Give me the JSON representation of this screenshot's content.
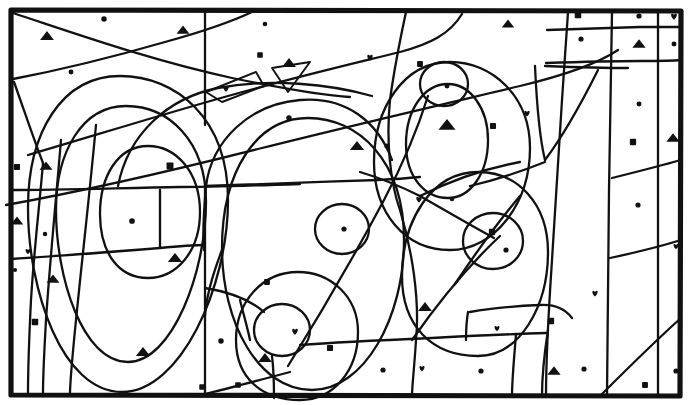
{
  "figure": {
    "kind": "line-drawing",
    "width": 690,
    "height": 405,
    "background_color": "#ffffff",
    "ink_color": "#111111",
    "frame": {
      "x": 9,
      "y": 8,
      "width": 672,
      "height": 389,
      "stroke_width": 5,
      "label": "outer-border"
    },
    "symbol_legend": [
      {
        "key": "dot",
        "name": "filled-circle-symbol",
        "glyph": "●",
        "count": 24
      },
      {
        "key": "triangle",
        "name": "filled-triangle-symbol",
        "glyph": "▲",
        "count": 21
      },
      {
        "key": "square",
        "name": "filled-square-symbol",
        "glyph": "■",
        "count": 22
      },
      {
        "key": "heart",
        "name": "filled-heart-symbol",
        "glyph": "♥",
        "count": 15
      }
    ],
    "symbols": [
      {
        "t": "dot",
        "x": 104,
        "y": 19,
        "s": 4.4
      },
      {
        "t": "triangle",
        "x": 47,
        "y": 36,
        "s": 6.0
      },
      {
        "t": "triangle",
        "x": 183,
        "y": 30,
        "s": 5.6
      },
      {
        "t": "dot",
        "x": 265,
        "y": 24,
        "s": 3.8
      },
      {
        "t": "triangle",
        "x": 508,
        "y": 24,
        "s": 5.4
      },
      {
        "t": "square",
        "x": 578,
        "y": 15,
        "s": 6.0
      },
      {
        "t": "dot",
        "x": 639,
        "y": 16,
        "s": 4.2
      },
      {
        "t": "heart",
        "x": 674,
        "y": 16,
        "s": 6.6
      },
      {
        "t": "dot",
        "x": 71,
        "y": 72,
        "s": 4.0
      },
      {
        "t": "square",
        "x": 260,
        "y": 55,
        "s": 5.2
      },
      {
        "t": "triangle",
        "x": 289,
        "y": 63,
        "s": 6.0
      },
      {
        "t": "heart",
        "x": 226,
        "y": 88,
        "s": 6.4
      },
      {
        "t": "heart",
        "x": 370,
        "y": 57,
        "s": 6.2
      },
      {
        "t": "square",
        "x": 420,
        "y": 64,
        "s": 5.4
      },
      {
        "t": "dot",
        "x": 581,
        "y": 39,
        "s": 4.2
      },
      {
        "t": "triangle",
        "x": 639,
        "y": 44,
        "s": 5.8
      },
      {
        "t": "dot",
        "x": 674,
        "y": 44,
        "s": 4.0
      },
      {
        "t": "dot",
        "x": 447,
        "y": 86,
        "s": 4.0
      },
      {
        "t": "dot",
        "x": 289,
        "y": 118,
        "s": 4.4
      },
      {
        "t": "triangle",
        "x": 447,
        "y": 125,
        "s": 7.4
      },
      {
        "t": "square",
        "x": 493,
        "y": 126,
        "s": 5.6
      },
      {
        "t": "heart",
        "x": 527,
        "y": 113,
        "s": 6.0
      },
      {
        "t": "square",
        "x": 170,
        "y": 166,
        "s": 6.4
      },
      {
        "t": "square",
        "x": 17,
        "y": 167,
        "s": 5.6
      },
      {
        "t": "triangle",
        "x": 46,
        "y": 166,
        "s": 5.6
      },
      {
        "t": "triangle",
        "x": 357,
        "y": 146,
        "s": 6.2
      },
      {
        "t": "dot",
        "x": 387,
        "y": 146,
        "s": 4.2
      },
      {
        "t": "square",
        "x": 633,
        "y": 142,
        "s": 5.8
      },
      {
        "t": "triangle",
        "x": 673,
        "y": 138,
        "s": 5.8
      },
      {
        "t": "dot",
        "x": 132,
        "y": 221,
        "s": 4.6
      },
      {
        "t": "triangle",
        "x": 17,
        "y": 221,
        "s": 5.4
      },
      {
        "t": "dot",
        "x": 45,
        "y": 234,
        "s": 3.6
      },
      {
        "t": "heart",
        "x": 28,
        "y": 251,
        "s": 5.6
      },
      {
        "t": "dot",
        "x": 15,
        "y": 270,
        "s": 3.4
      },
      {
        "t": "triangle",
        "x": 175,
        "y": 258,
        "s": 6.2
      },
      {
        "t": "dot",
        "x": 344,
        "y": 229,
        "s": 4.2
      },
      {
        "t": "heart",
        "x": 419,
        "y": 199,
        "s": 6.2
      },
      {
        "t": "square",
        "x": 492,
        "y": 232,
        "s": 5.8
      },
      {
        "t": "dot",
        "x": 506,
        "y": 250,
        "s": 4.2
      },
      {
        "t": "dot",
        "x": 638,
        "y": 205,
        "s": 4.2
      },
      {
        "t": "heart",
        "x": 676,
        "y": 246,
        "s": 5.6
      },
      {
        "t": "triangle",
        "x": 53,
        "y": 279,
        "s": 5.6
      },
      {
        "t": "square",
        "x": 267,
        "y": 282,
        "s": 5.4
      },
      {
        "t": "square",
        "x": 35,
        "y": 322,
        "s": 6.0
      },
      {
        "t": "triangle",
        "x": 425,
        "y": 307,
        "s": 6.0
      },
      {
        "t": "heart",
        "x": 295,
        "y": 331,
        "s": 6.4
      },
      {
        "t": "heart",
        "x": 497,
        "y": 328,
        "s": 5.6
      },
      {
        "t": "square",
        "x": 551,
        "y": 321,
        "s": 5.8
      },
      {
        "t": "heart",
        "x": 595,
        "y": 293,
        "s": 6.0
      },
      {
        "t": "triangle",
        "x": 143,
        "y": 352,
        "s": 6.2
      },
      {
        "t": "dot",
        "x": 221,
        "y": 341,
        "s": 4.4
      },
      {
        "t": "square",
        "x": 330,
        "y": 348,
        "s": 5.6
      },
      {
        "t": "triangle",
        "x": 265,
        "y": 358,
        "s": 6.0
      },
      {
        "t": "dot",
        "x": 383,
        "y": 370,
        "s": 4.2
      },
      {
        "t": "heart",
        "x": 422,
        "y": 368,
        "s": 5.8
      },
      {
        "t": "dot",
        "x": 481,
        "y": 371,
        "s": 4.2
      },
      {
        "t": "triangle",
        "x": 554,
        "y": 371,
        "s": 5.8
      },
      {
        "t": "dot",
        "x": 584,
        "y": 369,
        "s": 4.2
      },
      {
        "t": "square",
        "x": 238,
        "y": 385,
        "s": 5.2
      },
      {
        "t": "square",
        "x": 202,
        "y": 387,
        "s": 5.0
      },
      {
        "t": "square",
        "x": 645,
        "y": 385,
        "s": 5.4
      },
      {
        "t": "dot",
        "x": 676,
        "y": 371,
        "s": 4.2
      },
      {
        "t": "dot",
        "x": 639,
        "y": 104,
        "s": 4.0
      },
      {
        "t": "dot",
        "x": 452,
        "y": 199,
        "s": 3.6
      }
    ],
    "curves": [
      {
        "name": "left-outer-oval",
        "kind": "ellipse"
      },
      {
        "name": "left-middle-oval",
        "kind": "ellipse"
      },
      {
        "name": "left-inner-oval",
        "kind": "ellipse"
      },
      {
        "name": "center-large-oval",
        "kind": "ellipse"
      },
      {
        "name": "center-small-circle",
        "kind": "circle"
      },
      {
        "name": "lower-center-oval",
        "kind": "ellipse"
      },
      {
        "name": "lower-center-inner-circle",
        "kind": "circle"
      },
      {
        "name": "upper-right-big-oval",
        "kind": "ellipse"
      },
      {
        "name": "upper-right-mid-oval",
        "kind": "ellipse"
      },
      {
        "name": "upper-right-inner-circle",
        "kind": "circle"
      },
      {
        "name": "right-lower-oval",
        "kind": "ellipse"
      },
      {
        "name": "right-small-circle",
        "kind": "circle"
      },
      {
        "name": "top-center-triangle",
        "kind": "polygon"
      },
      {
        "name": "top-center-wedge",
        "kind": "polygon"
      }
    ]
  }
}
